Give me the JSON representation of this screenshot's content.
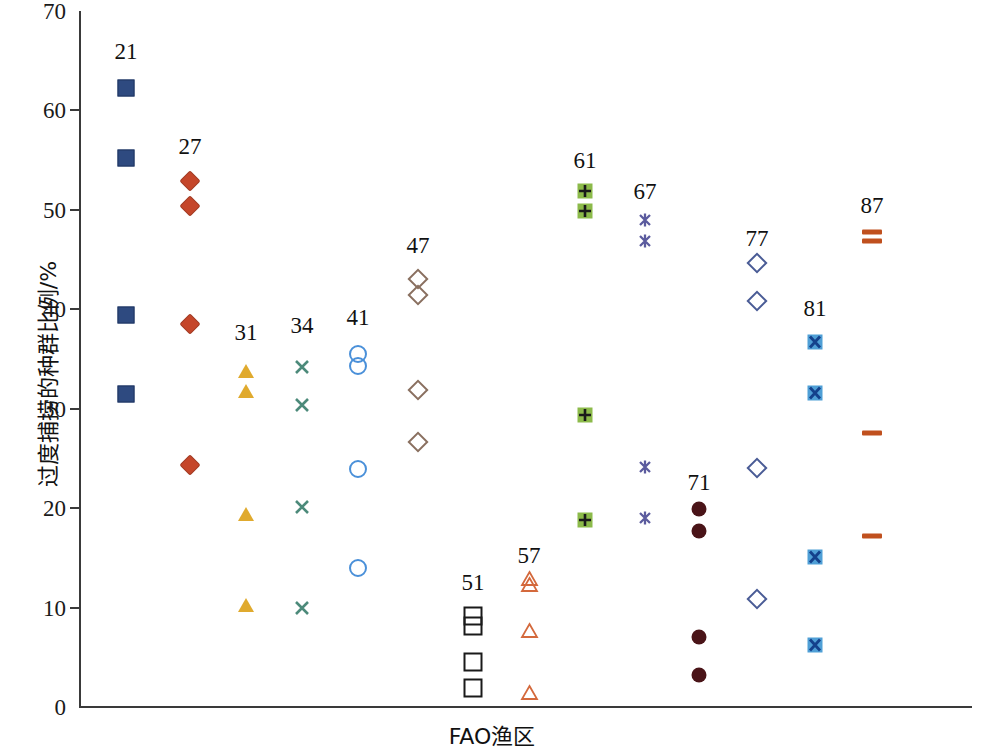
{
  "chart_data": {
    "type": "scatter",
    "title": "",
    "xlabel": "FAO渔区",
    "ylabel": "过度捕捞的种群比例/%",
    "ylim": [
      0,
      70
    ],
    "yticks": [
      0,
      10,
      20,
      30,
      40,
      50,
      60,
      70
    ],
    "ytick_labels": [
      "0",
      "10",
      "20",
      "30",
      "40",
      "50",
      "60",
      "70"
    ],
    "grid": false,
    "legend_position": "none",
    "x_category_note": "FAO major fishing areas, labelled above each column of points",
    "series": [
      {
        "name": "21",
        "label": "21",
        "marker": "square-filled",
        "color": "#2e4a80",
        "edge": "#1f3560",
        "x_px": 126,
        "label_y": 63,
        "values": [
          62.3,
          55.2,
          39.4,
          31.5
        ]
      },
      {
        "name": "27",
        "label": "27",
        "marker": "diamond-filled",
        "color": "#c5462a",
        "edge": "#a23a22",
        "x_px": 190,
        "label_y": 158,
        "values": [
          52.9,
          50.4,
          38.5,
          24.3
        ]
      },
      {
        "name": "31",
        "label": "31",
        "marker": "triangle-filled",
        "color": "#e0aa2e",
        "edge": "#b98a22",
        "x_px": 246,
        "label_y": 344,
        "values": [
          33.8,
          31.8,
          19.4,
          10.3
        ]
      },
      {
        "name": "34",
        "label": "34",
        "marker": "x-cross",
        "color": "#4c8a7a",
        "edge": "#3f7365",
        "x_px": 302,
        "label_y": 337,
        "values": [
          34.2,
          30.4,
          20.1,
          10.0
        ]
      },
      {
        "name": "41",
        "label": "41",
        "marker": "circle-open",
        "color": "#4a90d9",
        "edge": "#4a90d9",
        "x_px": 358,
        "label_y": 329,
        "values": [
          35.5,
          34.3,
          23.9,
          14.0
        ]
      },
      {
        "name": "47",
        "label": "47",
        "marker": "diamond-open",
        "color": "#8a7060",
        "edge": "#8a7060",
        "x_px": 418,
        "label_y": 257,
        "values": [
          43.0,
          41.4,
          31.9,
          26.7
        ]
      },
      {
        "name": "51",
        "label": "51",
        "marker": "square-open",
        "color": "#1a1a1a",
        "edge": "#1a1a1a",
        "x_px": 473,
        "label_y": 594,
        "values": [
          9.2,
          8.1,
          4.5,
          1.9
        ]
      },
      {
        "name": "57",
        "label": "57",
        "marker": "triangle-open",
        "color": "#d4693c",
        "edge": "#d4693c",
        "x_px": 529,
        "label_y": 567,
        "values": [
          12.9,
          12.3,
          7.7,
          1.5
        ]
      },
      {
        "name": "61",
        "label": "61",
        "marker": "square-plus",
        "color": "#8cba4a",
        "edge": "#1a1a1a",
        "x_px": 585,
        "label_y": 172,
        "values": [
          51.9,
          49.9,
          29.4,
          18.8
        ]
      },
      {
        "name": "67",
        "label": "67",
        "marker": "asterisk",
        "color": "#5b5b9e",
        "edge": "#5b5b9e",
        "x_px": 645,
        "label_y": 203,
        "values": [
          49.0,
          46.9,
          24.1,
          19.0
        ]
      },
      {
        "name": "71",
        "label": "71",
        "marker": "circle-filled",
        "color": "#4a1418",
        "edge": "#4a1418",
        "x_px": 699,
        "label_y": 494,
        "values": [
          19.9,
          17.7,
          7.0,
          3.2
        ]
      },
      {
        "name": "77",
        "label": "77",
        "marker": "diamond-open",
        "color": "#4a5c96",
        "edge": "#4a5c96",
        "x_px": 757,
        "label_y": 250,
        "values": [
          44.7,
          40.8,
          24.0,
          10.9
        ]
      },
      {
        "name": "81",
        "label": "81",
        "marker": "square-x",
        "color": "#4f9fd6",
        "edge": "#14418c",
        "x_px": 815,
        "label_y": 320,
        "values": [
          36.7,
          31.6,
          15.1,
          6.2
        ]
      },
      {
        "name": "87",
        "label": "87",
        "marker": "dash",
        "color": "#c0501e",
        "edge": "#c0501e",
        "x_px": 872,
        "label_y": 217,
        "values": [
          47.8,
          46.9,
          27.6,
          17.2
        ]
      }
    ]
  }
}
